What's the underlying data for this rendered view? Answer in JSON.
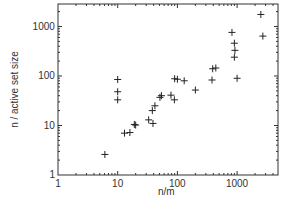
{
  "chart_data": {
    "type": "scatter",
    "title": "",
    "xlabel": "n/m",
    "ylabel": "n / active set size",
    "xscale": "log",
    "yscale": "log",
    "xlim": [
      1,
      4500
    ],
    "ylim": [
      1,
      3000
    ],
    "grid": false,
    "legend": null,
    "marker": "+",
    "x_ticks": [
      "1",
      "10",
      "100",
      "1000"
    ],
    "y_ticks": [
      "1",
      "10",
      "100",
      "1000"
    ],
    "series": [
      {
        "name": "data",
        "points": [
          [
            6.1,
            2.6
          ],
          [
            10,
            85
          ],
          [
            10,
            48
          ],
          [
            10,
            33
          ],
          [
            13,
            7.0
          ],
          [
            16,
            7.2
          ],
          [
            19,
            10.5
          ],
          [
            20,
            10.2
          ],
          [
            33,
            13
          ],
          [
            39,
            11
          ],
          [
            38,
            20
          ],
          [
            42,
            25
          ],
          [
            51,
            37
          ],
          [
            54,
            40
          ],
          [
            78,
            41
          ],
          [
            89,
            33
          ],
          [
            90,
            88
          ],
          [
            100,
            86
          ],
          [
            130,
            80
          ],
          [
            200,
            52
          ],
          [
            380,
            83
          ],
          [
            390,
            140
          ],
          [
            440,
            145
          ],
          [
            820,
            760
          ],
          [
            900,
            460
          ],
          [
            920,
            330
          ],
          [
            900,
            240
          ],
          [
            1000,
            90
          ],
          [
            2500,
            1750
          ],
          [
            2700,
            640
          ]
        ]
      }
    ]
  },
  "axes": {
    "x_tick_labels": [
      "1",
      "10",
      "100",
      "1000"
    ],
    "y_tick_labels": [
      "1",
      "10",
      "100",
      "1000"
    ],
    "xlabel": "n/m",
    "ylabel": "n / active set size"
  }
}
